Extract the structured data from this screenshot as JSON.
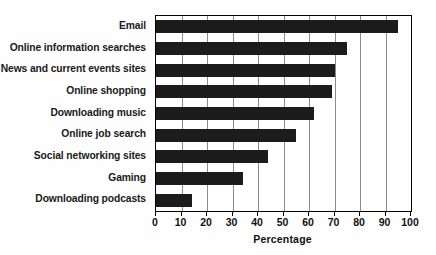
{
  "chart_data": {
    "type": "bar",
    "orientation": "horizontal",
    "title": "",
    "xlabel": "Percentage",
    "ylabel": "",
    "categories": [
      "Email",
      "Online information searches",
      "News and current events sites",
      "Online shopping",
      "Downloading music",
      "Online job search",
      "Social networking sites",
      "Gaming",
      "Downloading podcasts"
    ],
    "values": [
      95,
      75,
      70,
      69,
      62,
      55,
      44,
      34,
      14
    ],
    "xlim": [
      0,
      100
    ],
    "xticks": [
      0,
      10,
      20,
      30,
      40,
      50,
      60,
      70,
      80,
      90,
      100
    ],
    "xtick_labels": [
      "0",
      "10",
      "20",
      "30",
      "40",
      "50",
      "60",
      "70",
      "80",
      "90",
      "100"
    ],
    "grid": "vertical",
    "legend": "none",
    "bar_color": "#1c1c1c",
    "background_color": "#ffffff",
    "axis_color": "#000000",
    "gridline_color": "#8b8b8b"
  }
}
